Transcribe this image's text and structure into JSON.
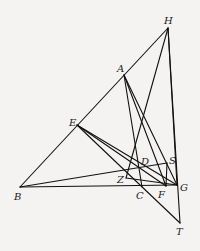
{
  "diagram": {
    "type": "geometric-figure",
    "background": "#f4f3f1",
    "stroke": "#111111",
    "points": {
      "H": {
        "x": 168,
        "y": 28
      },
      "A": {
        "x": 124,
        "y": 75
      },
      "E": {
        "x": 77,
        "y": 125
      },
      "B": {
        "x": 20,
        "y": 187
      },
      "C": {
        "x": 142,
        "y": 187
      },
      "F": {
        "x": 166,
        "y": 186
      },
      "G": {
        "x": 177,
        "y": 185
      },
      "D": {
        "x": 140,
        "y": 167
      },
      "S": {
        "x": 167,
        "y": 163
      },
      "Z": {
        "x": 126,
        "y": 178
      },
      "T": {
        "x": 180,
        "y": 223
      }
    },
    "labels": [
      {
        "id": "H",
        "text": "H",
        "x": 164,
        "y": 24
      },
      {
        "id": "A",
        "text": "A",
        "x": 117,
        "y": 72
      },
      {
        "id": "E",
        "text": "E",
        "x": 69,
        "y": 126
      },
      {
        "id": "B",
        "text": "B",
        "x": 14,
        "y": 200
      },
      {
        "id": "C",
        "text": "C",
        "x": 136,
        "y": 199
      },
      {
        "id": "F",
        "text": "F",
        "x": 158,
        "y": 198
      },
      {
        "id": "G",
        "text": "G",
        "x": 180,
        "y": 191
      },
      {
        "id": "D",
        "text": "D",
        "x": 141,
        "y": 165
      },
      {
        "id": "S",
        "text": "S",
        "x": 169,
        "y": 164
      },
      {
        "id": "Z",
        "text": "Z",
        "x": 117,
        "y": 183
      },
      {
        "id": "T",
        "text": "T",
        "x": 176,
        "y": 235
      }
    ],
    "segments": [
      [
        "B",
        "H"
      ],
      [
        "B",
        "G"
      ],
      [
        "B",
        "S"
      ],
      [
        "H",
        "G"
      ],
      [
        "H",
        "T"
      ],
      [
        "H",
        "Z"
      ],
      [
        "A",
        "C"
      ],
      [
        "A",
        "F"
      ],
      [
        "A",
        "G"
      ],
      [
        "E",
        "G"
      ],
      [
        "E",
        "F"
      ],
      [
        "E",
        "T"
      ],
      [
        "Z",
        "G"
      ],
      [
        "S",
        "F"
      ]
    ]
  }
}
